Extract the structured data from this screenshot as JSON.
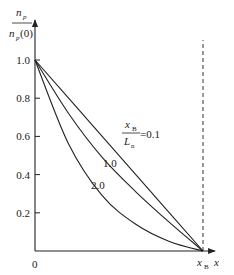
{
  "chart_data": {
    "type": "line",
    "title": "",
    "xlabel": "x",
    "ylabel": "n_p / n_p(0)",
    "ylabel_parts": {
      "numerator": "n",
      "numerator_sub": "p",
      "denominator": "n",
      "denominator_sub": "p",
      "denominator_arg": "(0)"
    },
    "xlim": [
      0,
      1
    ],
    "ylim": [
      0,
      1.0
    ],
    "x_ticks": [
      {
        "label": "0",
        "value": 0
      },
      {
        "label": "x",
        "sub": "B",
        "value": 1
      }
    ],
    "y_ticks": [
      {
        "label": "0.2",
        "value": 0.2
      },
      {
        "label": "0.4",
        "value": 0.4
      },
      {
        "label": "0.6",
        "value": 0.6
      },
      {
        "label": "0.8",
        "value": 0.8
      },
      {
        "label": "1.0",
        "value": 1.0
      }
    ],
    "grid": false,
    "legend": "inline labels",
    "annotation": {
      "fraction_num": "x",
      "fraction_num_sub": "B",
      "fraction_den": "L",
      "fraction_den_sub": "n",
      "eq": "=0.1"
    },
    "reference_line": {
      "type": "vertical-dashed",
      "x": 1,
      "label": "x_B"
    },
    "series": [
      {
        "name": "x_B/L_n = 0.1",
        "label": "=0.1",
        "x": [
          0,
          0.2,
          0.4,
          0.6,
          0.8,
          1.0
        ],
        "values": [
          1.0,
          0.8,
          0.6,
          0.4,
          0.2,
          0.0
        ]
      },
      {
        "name": "x_B/L_n = 1.0",
        "label": "1.0",
        "x": [
          0,
          0.2,
          0.4,
          0.6,
          0.8,
          1.0
        ],
        "values": [
          1.0,
          0.72,
          0.49,
          0.31,
          0.15,
          0.0
        ]
      },
      {
        "name": "x_B/L_n = 2.0",
        "label": "2.0",
        "x": [
          0,
          0.2,
          0.4,
          0.6,
          0.8,
          1.0
        ],
        "values": [
          1.0,
          0.56,
          0.29,
          0.14,
          0.05,
          0.0
        ]
      }
    ]
  }
}
